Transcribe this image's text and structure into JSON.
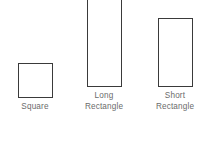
{
  "diagram": {
    "background_color": "#ffffff",
    "stroke_color": "#3a3a3a",
    "label_color": "#6b6b6b",
    "shapes": [
      {
        "name": "square",
        "label": "Square",
        "width_px": 35,
        "height_px": 35,
        "x_px": 17,
        "y_top_px": 77,
        "y_bottom_px": 112
      },
      {
        "name": "long-rectangle",
        "label": "Long\nRectangle",
        "width_px": 35,
        "height_px": 105,
        "x_px": 86,
        "y_top_px": 7,
        "y_bottom_px": 112
      },
      {
        "name": "short-rectangle",
        "label": "Short\nRectangle",
        "width_px": 35,
        "height_px": 69,
        "x_px": 158,
        "y_top_px": 43,
        "y_bottom_px": 112
      }
    ]
  }
}
